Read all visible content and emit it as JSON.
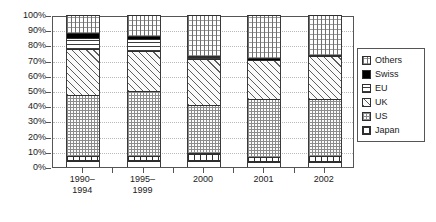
{
  "chart_data": {
    "type": "bar",
    "subtype": "stacked-percentage-column",
    "title": "",
    "xlabel": "",
    "ylabel": "",
    "ylim": [
      0,
      100
    ],
    "ytick_labels": [
      "0%",
      "10%",
      "20%",
      "30%",
      "40%",
      "50%",
      "60%",
      "70%",
      "80%",
      "90%",
      "100%"
    ],
    "ytick_values": [
      0,
      10,
      20,
      30,
      40,
      50,
      60,
      70,
      80,
      90,
      100
    ],
    "grid": true,
    "grid_style": "dotted horizontal",
    "legend_position": "right",
    "stack_order_bottom_to_top": [
      "Japan",
      "US",
      "UK",
      "EU",
      "Swiss",
      "Others"
    ],
    "categories": [
      "1990–1994",
      "1995–1999",
      "2000",
      "2001",
      "2002"
    ],
    "series": [
      {
        "name": "Japan",
        "values": [
          4.0,
          4.0,
          6.0,
          4.0,
          4.5
        ]
      },
      {
        "name": "US",
        "values": [
          40.5,
          43.5,
          32.0,
          39.0,
          38.0
        ]
      },
      {
        "name": "UK",
        "values": [
          31.0,
          27.0,
          31.0,
          26.0,
          29.0
        ]
      },
      {
        "name": "EU",
        "values": [
          8.0,
          8.5,
          2.0,
          0.0,
          0.0
        ]
      },
      {
        "name": "Swiss",
        "values": [
          4.0,
          2.5,
          1.5,
          2.0,
          1.5
        ]
      },
      {
        "name": "Others",
        "values": [
          12.5,
          14.5,
          27.5,
          29.0,
          27.0
        ]
      }
    ]
  },
  "legend": {
    "entries": [
      {
        "label": "Others",
        "pattern": "cross-hatch-dotted"
      },
      {
        "label": "Swiss",
        "pattern": "solid-black"
      },
      {
        "label": "EU",
        "pattern": "horizontal-lines"
      },
      {
        "label": "UK",
        "pattern": "diagonal-hatch"
      },
      {
        "label": "US",
        "pattern": "fine-dots"
      },
      {
        "label": "Japan",
        "pattern": "coarse-dots"
      }
    ]
  },
  "colors": {
    "frame": "#555555",
    "gridline": "#b9b9b9",
    "swiss": "#000000",
    "background": "#ffffff",
    "text": "#1a1a1a"
  }
}
